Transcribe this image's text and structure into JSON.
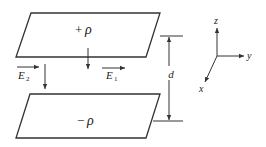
{
  "diagram": {
    "top_plate": {
      "label_sign": "+",
      "label_symbol": "ρ"
    },
    "bottom_plate": {
      "label_sign": "−",
      "label_symbol": "ρ"
    },
    "field_labels": {
      "e1": {
        "letter": "E",
        "sub": "1"
      },
      "e2": {
        "letter": "E",
        "sub": "2"
      }
    },
    "separation_label": "d",
    "axes": {
      "x": "x",
      "y": "y",
      "z": "z"
    },
    "colors": {
      "line": "#333333",
      "text": "#222222"
    }
  }
}
